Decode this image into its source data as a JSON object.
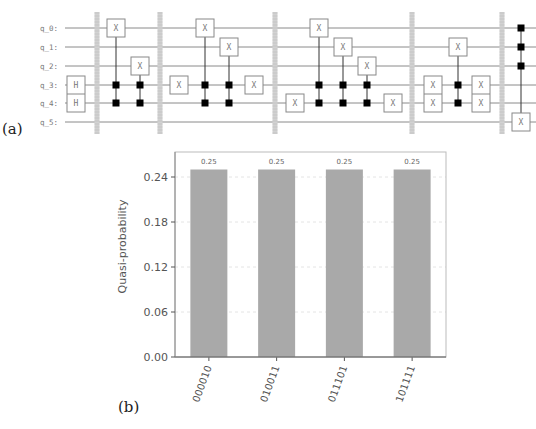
{
  "panels": {
    "a_label": "(a)",
    "b_label": "(b)"
  },
  "circuit": {
    "qubits": [
      "q_0:",
      "q_1:",
      "q_2:",
      "q_3:",
      "q_4:",
      "q_5:"
    ],
    "barrier_count": 5,
    "blocks": [
      {
        "name": "block-1",
        "ops": [
          {
            "type": "single",
            "gate": "H",
            "targets": [
              3,
              4
            ],
            "col": 0
          },
          {
            "type": "barrier",
            "col": 1
          },
          {
            "type": "ccx",
            "gate": "X",
            "controls": [
              3,
              4
            ],
            "target": 0,
            "col": 2
          },
          {
            "type": "ccx",
            "gate": "X",
            "controls": [
              3,
              4
            ],
            "target": 2,
            "col": 3
          },
          {
            "type": "barrier",
            "col": 4
          }
        ]
      },
      {
        "name": "block-2",
        "ops": [
          {
            "type": "single",
            "gate": "X",
            "targets": [
              3
            ],
            "col": 5
          },
          {
            "type": "ccx",
            "gate": "X",
            "controls": [
              3,
              4
            ],
            "target": 0,
            "col": 6
          },
          {
            "type": "ccx",
            "gate": "X",
            "controls": [
              3,
              4
            ],
            "target": 1,
            "col": 7
          },
          {
            "type": "single",
            "gate": "X",
            "targets": [
              3
            ],
            "col": 8
          },
          {
            "type": "barrier",
            "col": 9
          }
        ]
      },
      {
        "name": "block-3",
        "ops": [
          {
            "type": "single",
            "gate": "X",
            "targets": [
              4
            ],
            "col": 10
          },
          {
            "type": "ccx",
            "gate": "X",
            "controls": [
              3,
              4
            ],
            "target": 0,
            "col": 11
          },
          {
            "type": "ccx",
            "gate": "X",
            "controls": [
              3,
              4
            ],
            "target": 1,
            "col": 12
          },
          {
            "type": "ccx",
            "gate": "X",
            "controls": [
              3,
              4
            ],
            "target": 2,
            "col": 13
          },
          {
            "type": "single",
            "gate": "X",
            "targets": [
              4
            ],
            "col": 14
          },
          {
            "type": "barrier",
            "col": 15
          }
        ]
      },
      {
        "name": "block-4",
        "ops": [
          {
            "type": "single",
            "gate": "X",
            "targets": [
              3,
              4
            ],
            "col": 16
          },
          {
            "type": "ccx",
            "gate": "X",
            "controls": [
              3,
              4
            ],
            "target": 1,
            "col": 17
          },
          {
            "type": "single",
            "gate": "X",
            "targets": [
              3,
              4
            ],
            "col": 18
          },
          {
            "type": "barrier",
            "col": 19
          }
        ]
      },
      {
        "name": "block-5",
        "ops": [
          {
            "type": "mcx",
            "gate": "X",
            "controls": [
              0,
              1,
              2
            ],
            "target": 5,
            "col": 20
          }
        ]
      }
    ]
  },
  "chart_data": {
    "type": "bar",
    "title": "",
    "xlabel": "",
    "ylabel": "Quasi-probability",
    "categories": [
      "000010",
      "010011",
      "011101",
      "101111"
    ],
    "values": [
      0.25,
      0.25,
      0.25,
      0.25
    ],
    "data_labels": [
      "0.25",
      "0.25",
      "0.25",
      "0.25"
    ],
    "ylim": [
      0,
      0.27
    ],
    "yticks": [
      0.0,
      0.06,
      0.12,
      0.18,
      0.24
    ],
    "ytick_labels": [
      "0.00",
      "0.06",
      "0.12",
      "0.18",
      "0.24"
    ],
    "grid": true,
    "grid_style": "dashed",
    "xtick_rotation_deg": 70,
    "bar_color": "#a9a9a9",
    "legend": "none"
  }
}
